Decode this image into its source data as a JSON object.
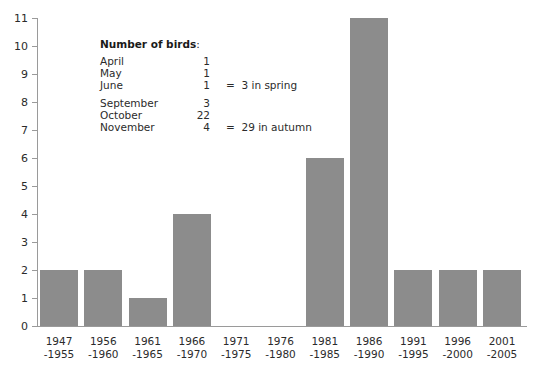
{
  "chart_data": {
    "type": "bar",
    "title": "",
    "subtitle": "",
    "xlabel": "",
    "ylabel": "",
    "grid": false,
    "legend_position": "inside-top-left",
    "bar_color": "#8c8c8c",
    "axis_color": "#9a9a9a",
    "text_color": "#2b2b2b",
    "ylim": [
      0,
      11
    ],
    "ytick_step": 1,
    "yticks": [
      "11",
      "10",
      "9",
      "8",
      "7",
      "6",
      "5",
      "4",
      "3",
      "2",
      "1",
      "0"
    ],
    "categories": [
      "1947\n-1955",
      "1956\n-1960",
      "1961\n-1965",
      "1966\n-1970",
      "1971\n-1975",
      "1976\n-1980",
      "1981\n-1985",
      "1986\n-1990",
      "1991\n-1995",
      "1996\n-2000",
      "2001\n-2005"
    ],
    "category_lines": [
      [
        "1947",
        "-1955"
      ],
      [
        "1956",
        "-1960"
      ],
      [
        "1961",
        "-1965"
      ],
      [
        "1966",
        "-1970"
      ],
      [
        "1971",
        "-1975"
      ],
      [
        "1976",
        "-1980"
      ],
      [
        "1981",
        "-1985"
      ],
      [
        "1986",
        "-1990"
      ],
      [
        "1991",
        "-1995"
      ],
      [
        "1996",
        "-2000"
      ],
      [
        "2001",
        "-2005"
      ]
    ],
    "values": [
      2,
      2,
      1,
      4,
      0,
      0,
      6,
      11,
      2,
      2,
      2
    ]
  },
  "legend": {
    "title": "Number of birds",
    "title_colon": ":",
    "rows": [
      {
        "month": "April",
        "count": "1",
        "note": ""
      },
      {
        "month": "May",
        "count": "1",
        "note": ""
      },
      {
        "month": "June",
        "count": "1",
        "note": "=  3 in spring"
      },
      {
        "month": "September",
        "count": "3",
        "note": ""
      },
      {
        "month": "October",
        "count": "22",
        "note": ""
      },
      {
        "month": "November",
        "count": "4",
        "note": "=  29 in autumn"
      }
    ]
  }
}
